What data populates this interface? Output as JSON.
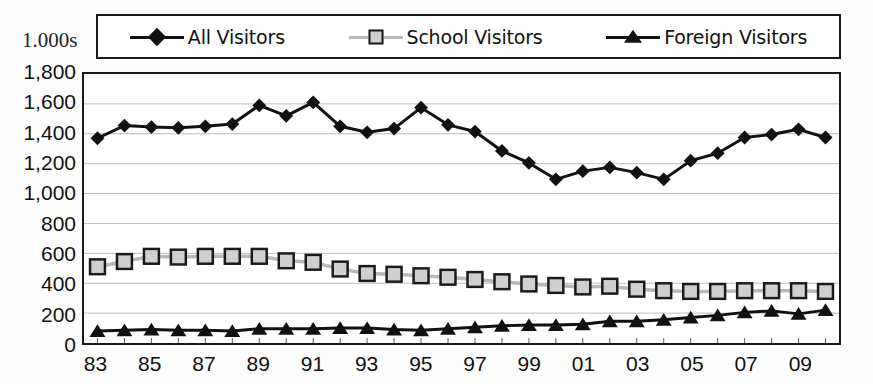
{
  "chart_data": {
    "type": "line",
    "title": "",
    "subtitle": "",
    "unit_label": "1.000s",
    "xlabel": "",
    "ylabel": "",
    "ylim": [
      0,
      1800
    ],
    "ytick_step": 200,
    "yticks": [
      "1,800",
      "1,600",
      "1,400",
      "1,200",
      "1,000",
      "800",
      "600",
      "400",
      "200",
      "0"
    ],
    "ytick_values": [
      1800,
      1600,
      1400,
      1200,
      1000,
      800,
      600,
      400,
      200,
      0
    ],
    "grid": true,
    "grid_axis": "y",
    "legend_position": "top",
    "x": [
      1983,
      1984,
      1985,
      1986,
      1987,
      1988,
      1989,
      1990,
      1991,
      1992,
      1993,
      1994,
      1995,
      1996,
      1997,
      1998,
      1999,
      2000,
      2001,
      2002,
      2003,
      2004,
      2005,
      2006,
      2007,
      2008,
      2009,
      2010
    ],
    "categories": [
      "83",
      "84",
      "85",
      "86",
      "87",
      "88",
      "89",
      "90",
      "91",
      "92",
      "93",
      "94",
      "95",
      "96",
      "97",
      "98",
      "99",
      "00",
      "01",
      "02",
      "03",
      "04",
      "05",
      "06",
      "07",
      "08",
      "09",
      "10"
    ],
    "xtick_labels_shown": [
      "83",
      "85",
      "87",
      "89",
      "91",
      "93",
      "95",
      "97",
      "99",
      "01",
      "03",
      "05",
      "07",
      "09"
    ],
    "xtick_label_interval": 2,
    "series": [
      {
        "name": "All Visitors",
        "marker": "diamond",
        "color": "#111111",
        "values": [
          1370,
          1455,
          1445,
          1440,
          1450,
          1465,
          1590,
          1520,
          1610,
          1450,
          1410,
          1435,
          1575,
          1460,
          1415,
          1285,
          1205,
          1095,
          1150,
          1175,
          1140,
          1095,
          1220,
          1270,
          1375,
          1395,
          1430,
          1375
        ]
      },
      {
        "name": "School Visitors",
        "marker": "square",
        "color": "#b9b9b9",
        "values": [
          510,
          545,
          580,
          575,
          580,
          580,
          580,
          550,
          540,
          495,
          465,
          460,
          450,
          440,
          425,
          410,
          395,
          385,
          375,
          380,
          360,
          350,
          345,
          345,
          350,
          350,
          350,
          345
        ]
      },
      {
        "name": "Foreign Visitors",
        "marker": "triangle",
        "color": "#111111",
        "values": [
          80,
          85,
          90,
          85,
          85,
          80,
          95,
          95,
          95,
          100,
          100,
          90,
          85,
          95,
          105,
          115,
          120,
          120,
          125,
          145,
          145,
          155,
          170,
          185,
          205,
          215,
          195,
          220
        ]
      }
    ]
  },
  "legend": {
    "entries": [
      {
        "label": "All Visitors",
        "marker": "diamond"
      },
      {
        "label": "School Visitors",
        "marker": "square"
      },
      {
        "label": "Foreign Visitors",
        "marker": "triangle"
      }
    ]
  }
}
